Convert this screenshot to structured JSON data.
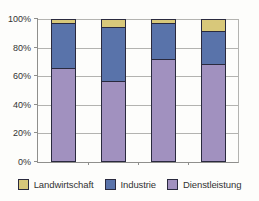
{
  "chart_data": {
    "type": "bar",
    "stacked": true,
    "percent_stacked": true,
    "title": "",
    "xlabel": "",
    "ylabel": "",
    "categories": [
      "",
      "",
      "",
      ""
    ],
    "series": [
      {
        "name": "Dienstleistung",
        "color": "#a191bf",
        "values": [
          66,
          57,
          72,
          69
        ]
      },
      {
        "name": "Industrie",
        "color": "#5973aa",
        "values": [
          32,
          38,
          26,
          23
        ]
      },
      {
        "name": "Landwirtschaft",
        "color": "#d8c87a",
        "values": [
          2,
          5,
          2,
          8
        ]
      }
    ],
    "legend": [
      {
        "name": "Landwirtschaft",
        "color": "#d8c87a"
      },
      {
        "name": "Industrie",
        "color": "#5973aa"
      },
      {
        "name": "Dienstleistung",
        "color": "#a191bf"
      }
    ],
    "y_ticks": [
      "0%",
      "20%",
      "40%",
      "60%",
      "80%",
      "100%"
    ],
    "ylim": [
      0,
      100
    ],
    "grid": true,
    "legend_position": "bottom"
  },
  "colors": {
    "background": "#fdfdfb",
    "grid": "#b3b3b0",
    "axis": "#8f8f8c",
    "bar_border": "#2a2a3e",
    "text": "#333333"
  }
}
